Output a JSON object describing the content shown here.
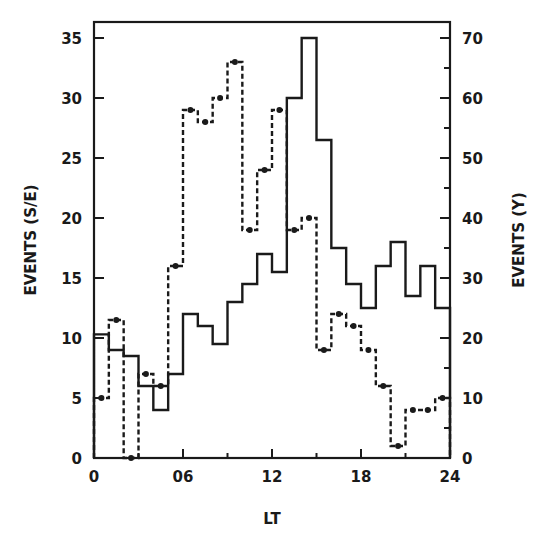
{
  "chart_data": {
    "type": "line",
    "subtype": "step-histogram",
    "title": "",
    "xlabel": "LT",
    "ylabel_left": "EVENTS (S/E)",
    "ylabel_right": "EVENTS (Y)",
    "xlim": [
      0,
      24
    ],
    "ylim_left": [
      0,
      35
    ],
    "ylim_right": [
      0,
      70
    ],
    "x_ticks": [
      0,
      6,
      12,
      18,
      24
    ],
    "x_tick_labels": [
      "0",
      "06",
      "12",
      "18",
      "24"
    ],
    "x_minor_ticks": [
      3,
      9,
      15,
      21
    ],
    "y_left_ticks": [
      0,
      5,
      10,
      15,
      20,
      25,
      30,
      35
    ],
    "y_left_tick_labels": [
      "0",
      "5",
      "10",
      "15",
      "20",
      "25",
      "30",
      "35"
    ],
    "y_right_ticks": [
      0,
      10,
      20,
      30,
      40,
      50,
      60,
      70
    ],
    "y_right_tick_labels": [
      "0",
      "10",
      "20",
      "30",
      "40",
      "50",
      "60",
      "70"
    ],
    "y_right_minor_ticks": [
      5,
      15,
      25,
      35,
      45,
      55,
      65
    ],
    "grid": false,
    "legend": null,
    "x": [
      0,
      1,
      2,
      3,
      4,
      5,
      6,
      7,
      8,
      9,
      10,
      11,
      12,
      13,
      14,
      15,
      16,
      17,
      18,
      19,
      20,
      21,
      22,
      23
    ],
    "series": [
      {
        "name": "EVENTS (S/E)",
        "axis": "left",
        "style": "solid",
        "markers": false,
        "values": [
          10.3,
          9,
          8.5,
          6,
          4,
          7,
          12,
          11,
          9.5,
          13,
          14.5,
          17,
          15.5,
          30,
          35,
          26.5,
          17.5,
          14.5,
          12.5,
          16,
          18,
          13.5,
          16,
          12.5
        ]
      },
      {
        "name": "EVENTS (Y)",
        "axis": "right",
        "style": "dashed",
        "markers": true,
        "values": [
          10,
          23,
          0,
          14,
          12,
          32,
          58,
          56,
          60,
          66,
          38,
          48,
          58,
          38,
          40,
          18,
          24,
          22,
          18,
          12,
          2,
          8,
          8,
          10
        ]
      }
    ]
  },
  "colors": {
    "ink": "#1a1a1a",
    "background": "#ffffff"
  }
}
